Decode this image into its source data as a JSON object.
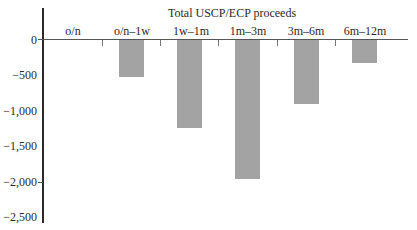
{
  "chart_data": {
    "type": "bar",
    "title": "Total USCP/ECP proceeds",
    "xlabel": "",
    "ylabel": "",
    "categories": [
      "o/n",
      "o/n–1w",
      "1w–1m",
      "1m–3m",
      "3m–6m",
      "6m–12m"
    ],
    "values": [
      0,
      -525,
      -1240,
      -1960,
      -900,
      -330
    ],
    "ylim": [
      -2500,
      0
    ],
    "yticks": [
      0,
      -500,
      -1000,
      -1500,
      -2000,
      -2500
    ],
    "ytick_labels": [
      "0",
      "−500",
      "−1,000",
      "−1,500",
      "−2,000",
      "−2,500"
    ],
    "grid": false,
    "legend": null,
    "x_axis_position": "top (at y=0)",
    "bar_color": "#a3a3a3"
  },
  "labels": {
    "title": "Total USCP/ECP proceeds",
    "categories": [
      "o/n",
      "o/n–1w",
      "1w–1m",
      "1m–3m",
      "3m–6m",
      "6m–12m"
    ],
    "yticks": [
      "0",
      "−500",
      "−1,000",
      "−1,500",
      "−2,000",
      "−2,500"
    ]
  }
}
